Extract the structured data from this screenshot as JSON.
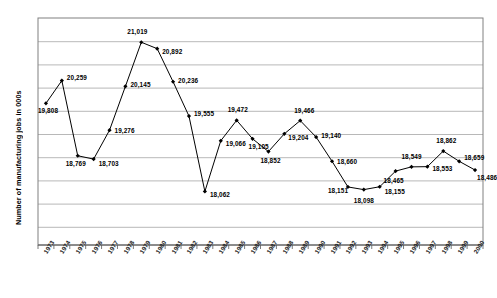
{
  "chart_data": {
    "type": "line",
    "title": "",
    "xlabel": "",
    "ylabel": "Number of manufacturing jobs in 000s",
    "ylim": [
      17000,
      21500
    ],
    "grid": true,
    "legend": "none",
    "categories": [
      "1973",
      "1974",
      "1975",
      "1976",
      "1977",
      "1978",
      "1979",
      "1980",
      "1981",
      "1982",
      "1983",
      "1984",
      "1985",
      "1986",
      "1987",
      "1988",
      "1989",
      "1990",
      "1991",
      "1992",
      "1993",
      "1994",
      "1995",
      "1996",
      "1997",
      "1998",
      "1999",
      "2000"
    ],
    "values": [
      19808,
      20259,
      18769,
      18703,
      19276,
      20145,
      21019,
      20892,
      20236,
      19555,
      18062,
      19066,
      19472,
      19105,
      18852,
      19204,
      19466,
      19140,
      18660,
      18151,
      18098,
      18155,
      18465,
      18549,
      18553,
      18862,
      18659,
      18486
    ],
    "point_labels": [
      "19,808",
      "20,259",
      "18,769",
      "18,703",
      "19,276",
      "20,145",
      "21,019",
      "20,892",
      "20,236",
      "19,555",
      "18,062",
      "19,066",
      "19,472",
      "19,105",
      "18,852",
      "19,204",
      "19,466",
      "19,140",
      "18,660",
      "18,151",
      "18,098",
      "18,155",
      "18,465",
      "18,549",
      "18,553",
      "18,862",
      "18,659",
      "18,486"
    ],
    "series_name": "Manufacturing jobs",
    "colors": {
      "line": "#000000",
      "marker": "#000000",
      "grid": "#a6a6a6",
      "axis": "#808080",
      "plot_background": "#ffffff"
    }
  }
}
